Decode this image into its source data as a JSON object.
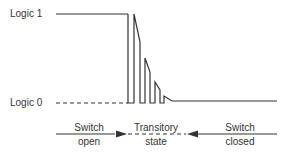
{
  "diagram": {
    "levels": {
      "high_label": "Logic 1",
      "low_label": "Logic 0"
    },
    "phases": [
      {
        "line1": "Switch",
        "line2": "open"
      },
      {
        "line1": "Transitory",
        "line2": "state"
      },
      {
        "line1": "Switch",
        "line2": "closed"
      }
    ],
    "colors": {
      "line": "#333333",
      "text": "#333333",
      "background": "#ffffff"
    }
  }
}
